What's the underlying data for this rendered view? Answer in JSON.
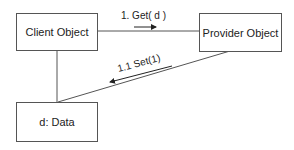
{
  "diagram": {
    "type": "UML collaboration diagram",
    "objects": [
      {
        "id": "client",
        "label": "Client Object"
      },
      {
        "id": "provider",
        "label": "Provider Object"
      },
      {
        "id": "data",
        "label": "d: Data"
      }
    ],
    "links": [
      {
        "from": "client",
        "to": "provider"
      },
      {
        "from": "client",
        "to": "data"
      },
      {
        "from": "provider",
        "to": "data"
      }
    ],
    "messages": [
      {
        "label": "1. Get( d )",
        "from": "client",
        "to": "provider",
        "direction": "right"
      },
      {
        "label": "1.1 Set(1)",
        "from": "provider",
        "to": "data",
        "direction": "down-left"
      }
    ],
    "colors": {
      "line": "#555555",
      "text": "#222222"
    }
  }
}
